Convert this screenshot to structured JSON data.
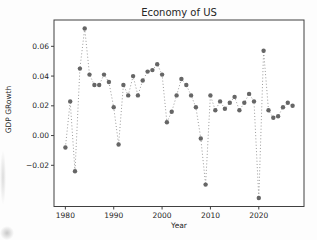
{
  "figure": {
    "title": "Economy of US",
    "xlabel": "Year",
    "ylabel": "GDP GRowth"
  },
  "chart_data": {
    "type": "line",
    "title": "Economy of US",
    "xlabel": "Year",
    "ylabel": "GDP GRowth",
    "line_style": "dotted",
    "marker": "circle",
    "grid": false,
    "legend": null,
    "x": [
      1980,
      1981,
      1982,
      1983,
      1984,
      1985,
      1986,
      1987,
      1988,
      1989,
      1990,
      1991,
      1992,
      1993,
      1994,
      1995,
      1996,
      1997,
      1998,
      1999,
      2000,
      2001,
      2002,
      2003,
      2004,
      2005,
      2006,
      2007,
      2008,
      2009,
      2010,
      2011,
      2012,
      2013,
      2014,
      2015,
      2016,
      2017,
      2018,
      2019,
      2020,
      2021,
      2022,
      2023,
      2024,
      2025,
      2026,
      2027
    ],
    "series": [
      {
        "name": "GDP Growth",
        "values": [
          -0.008,
          0.023,
          -0.024,
          0.045,
          0.072,
          0.041,
          0.034,
          0.034,
          0.041,
          0.036,
          0.019,
          -0.006,
          0.034,
          0.027,
          0.04,
          0.027,
          0.037,
          0.043,
          0.044,
          0.048,
          0.041,
          0.009,
          0.016,
          0.027,
          0.038,
          0.034,
          0.027,
          0.019,
          -0.002,
          -0.033,
          0.027,
          0.017,
          0.023,
          0.018,
          0.022,
          0.026,
          0.017,
          0.022,
          0.028,
          0.023,
          -0.042,
          0.057,
          0.017,
          0.012,
          0.013,
          0.019,
          0.022,
          0.02
        ]
      }
    ],
    "xlim": [
      1977.65,
      2029.35
    ],
    "ylim": [
      -0.0477,
      0.0777
    ],
    "xticks": [
      1980,
      1990,
      2000,
      2010,
      2020
    ],
    "xtick_labels": [
      "1980",
      "1990",
      "2000",
      "2010",
      "2020"
    ],
    "yticks": [
      -0.02,
      0.0,
      0.02,
      0.04,
      0.06
    ],
    "ytick_labels": [
      "−0.02",
      "0.00",
      "0.02",
      "0.04",
      "0.06"
    ],
    "colors": {
      "marker": "#666666",
      "line": "#8f8f8f",
      "spine": "#404040",
      "tick_text": "#262626",
      "background": "#ffffff"
    }
  }
}
